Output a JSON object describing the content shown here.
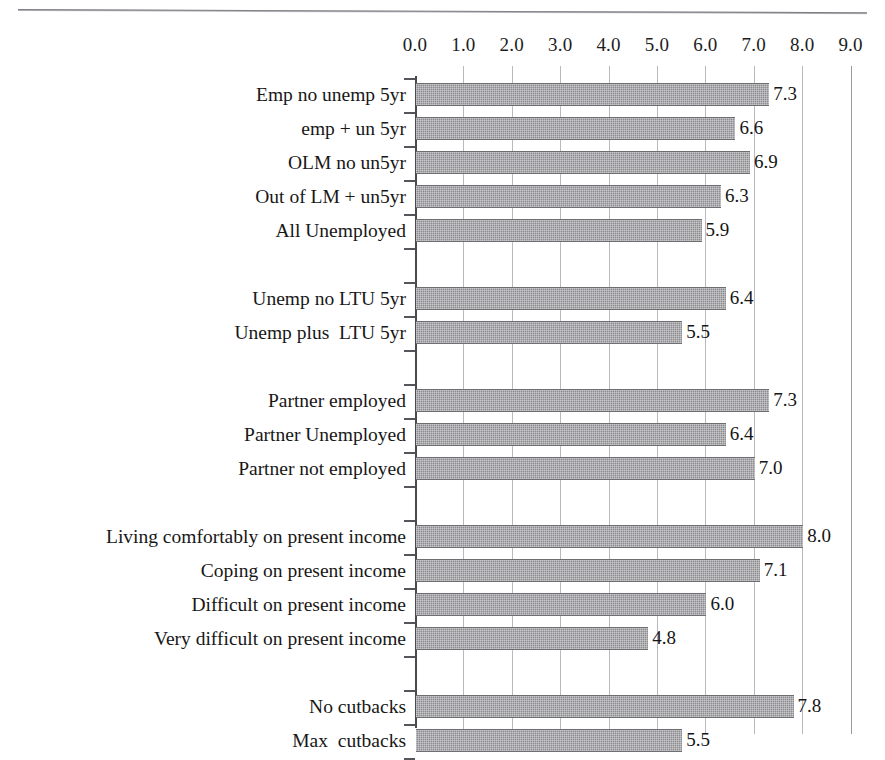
{
  "chart_data": {
    "type": "bar",
    "orientation": "horizontal",
    "title": "",
    "xlabel": "",
    "ylabel": "",
    "xlim": [
      0.0,
      9.0
    ],
    "xticks": [
      "0.0",
      "1.0",
      "2.0",
      "3.0",
      "4.0",
      "5.0",
      "6.0",
      "7.0",
      "8.0",
      "9.0"
    ],
    "grid": true,
    "legend": false,
    "bar_color": "#8c8c90",
    "categories": [
      "Emp no unemp 5yr",
      "emp + un 5yr",
      "OLM no un5yr",
      "Out of LM + un5yr",
      "All Unemployed",
      "",
      "Unemp no LTU 5yr",
      "Unemp plus  LTU 5yr",
      "",
      "Partner employed",
      "Partner Unemployed",
      "Partner not employed",
      "",
      "Living comfortably on present income",
      "Coping on present income",
      "Difficult on present income",
      "Very difficult on present income",
      "",
      "No cutbacks",
      "Max  cutbacks"
    ],
    "values": [
      7.3,
      6.6,
      6.9,
      6.3,
      5.9,
      null,
      6.4,
      5.5,
      null,
      7.3,
      6.4,
      7.0,
      null,
      8.0,
      7.1,
      6.0,
      4.8,
      null,
      7.8,
      5.5
    ],
    "value_labels": [
      "7.3",
      "6.6",
      "6.9",
      "6.3",
      "5.9",
      "",
      "6.4",
      "5.5",
      "",
      "7.3",
      "6.4",
      "7.0",
      "",
      "8.0",
      "7.1",
      "6.0",
      "4.8",
      "",
      "7.8",
      "5.5"
    ],
    "groups": [
      {
        "name": "labour-market-status",
        "rows": [
          0,
          1,
          2,
          3,
          4
        ]
      },
      {
        "name": "long-term-unemployment",
        "rows": [
          6,
          7
        ]
      },
      {
        "name": "partner-status",
        "rows": [
          9,
          10,
          11
        ]
      },
      {
        "name": "present-income",
        "rows": [
          13,
          14,
          15,
          16
        ]
      },
      {
        "name": "cutbacks",
        "rows": [
          18,
          19
        ]
      }
    ]
  }
}
